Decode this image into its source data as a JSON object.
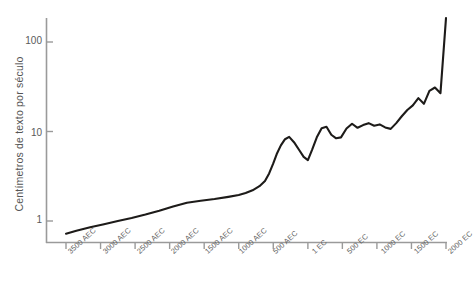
{
  "chart_data": {
    "type": "line",
    "title": "",
    "xlabel": "",
    "ylabel": "Centímetros de texto por século",
    "yscale": "log",
    "ylim": [
      0.55,
      230
    ],
    "grid": false,
    "legend": "none",
    "line_color": "#1d1b19",
    "axis_color": "#9a9a9a",
    "background": "#ffffff",
    "ytick_labels": [
      "1",
      "10",
      "100"
    ],
    "ytick_values": [
      1,
      10,
      100
    ],
    "categories": [
      "3500 AEC",
      "3000 AEC",
      "2500 AEC",
      "2000 AEC",
      "1500 AEC",
      "1000 AEC",
      "500 AEC",
      "1 EC",
      "500 EC",
      "1000 EC",
      "1500 EC",
      "2000 EC"
    ],
    "x": [
      -3500,
      -3000,
      -2500,
      -2000,
      -1500,
      -1000,
      -500,
      1,
      500,
      1000,
      1500,
      2000
    ],
    "series": [
      {
        "name": "Centímetros de texto por século",
        "x": [
          -3500,
          -3350,
          -3150,
          -2950,
          -2750,
          -2550,
          -2350,
          -2150,
          -1950,
          -1750,
          -1550,
          -1350,
          -1150,
          -1000,
          -900,
          -800,
          -700,
          -620,
          -560,
          -500,
          -450,
          -390,
          -330,
          -270,
          -200,
          -130,
          -60,
          1,
          60,
          130,
          200,
          270,
          340,
          410,
          480,
          560,
          640,
          720,
          800,
          880,
          960,
          1040,
          1120,
          1200,
          1280,
          1360,
          1440,
          1520,
          1600,
          1680,
          1760,
          1840,
          1920,
          2000
        ],
        "values": [
          0.72,
          0.78,
          0.85,
          0.92,
          1.0,
          1.08,
          1.18,
          1.3,
          1.45,
          1.6,
          1.68,
          1.76,
          1.86,
          1.95,
          2.05,
          2.2,
          2.45,
          2.8,
          3.4,
          4.4,
          5.6,
          7.0,
          8.2,
          8.7,
          7.6,
          6.3,
          5.2,
          4.8,
          6.2,
          8.6,
          10.9,
          11.3,
          9.2,
          8.4,
          8.6,
          10.8,
          12.2,
          11.0,
          11.8,
          12.4,
          11.6,
          12.0,
          11.1,
          10.7,
          12.4,
          14.8,
          17.4,
          19.6,
          23.6,
          20.4,
          28.5,
          31.0,
          26.8,
          185.0
        ]
      }
    ]
  }
}
